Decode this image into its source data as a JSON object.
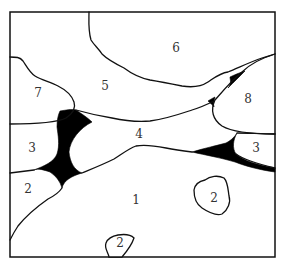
{
  "diagram": {
    "type": "region-map",
    "frame": {
      "x": 10,
      "y": 12,
      "width": 265,
      "height": 245
    },
    "colors": {
      "line": "#111111",
      "pore": "#000000",
      "background": "#ffffff",
      "label": "#333333"
    },
    "labels": [
      {
        "id": "region-1",
        "text": "1",
        "x": 136,
        "y": 200
      },
      {
        "id": "region-2-left",
        "text": "2",
        "x": 28,
        "y": 189
      },
      {
        "id": "region-2-island",
        "text": "2",
        "x": 214,
        "y": 198
      },
      {
        "id": "region-2-bottom",
        "text": "2",
        "x": 120,
        "y": 243
      },
      {
        "id": "region-3-left",
        "text": "3",
        "x": 32,
        "y": 148
      },
      {
        "id": "region-3-right",
        "text": "3",
        "x": 256,
        "y": 148
      },
      {
        "id": "region-4",
        "text": "4",
        "x": 139,
        "y": 134
      },
      {
        "id": "region-5",
        "text": "5",
        "x": 105,
        "y": 86
      },
      {
        "id": "region-6",
        "text": "6",
        "x": 176,
        "y": 48
      },
      {
        "id": "region-7",
        "text": "7",
        "x": 38,
        "y": 93
      },
      {
        "id": "region-8",
        "text": "8",
        "x": 248,
        "y": 99
      }
    ]
  }
}
